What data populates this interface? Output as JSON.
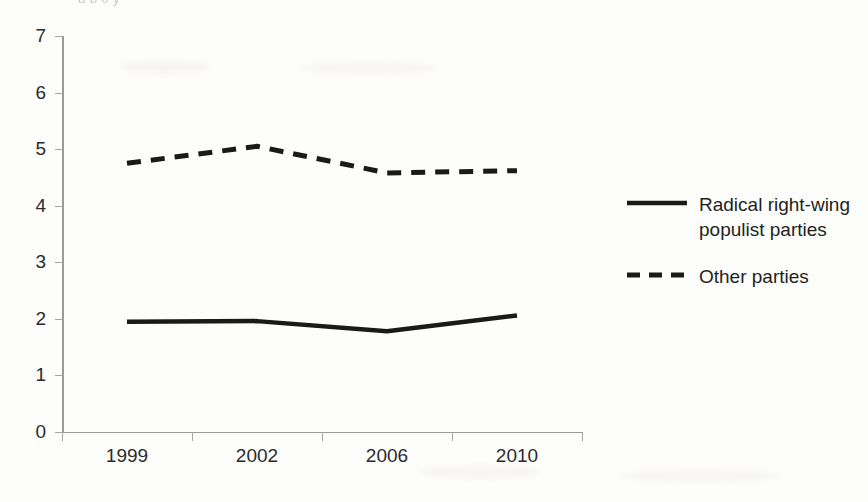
{
  "page": {
    "clipped_caption": "a   b                                                         0                              y"
  },
  "chart_data": {
    "type": "line",
    "title": "",
    "xlabel": "",
    "ylabel": "",
    "categories": [
      "1999",
      "2002",
      "2006",
      "2010"
    ],
    "ylim": [
      0,
      7
    ],
    "y_ticks": [
      "7",
      "6",
      "5",
      "4",
      "3",
      "2",
      "1",
      "0"
    ],
    "grid": false,
    "legend_position": "right",
    "series": [
      {
        "name": "Radical right-wing populist parties",
        "style": "solid",
        "color": "#1a1a1a",
        "values": [
          1.95,
          1.96,
          1.78,
          2.06
        ]
      },
      {
        "name": "Other parties",
        "style": "dashed",
        "color": "#1a1a1a",
        "values": [
          4.75,
          5.05,
          4.58,
          4.62
        ]
      }
    ]
  },
  "legend": {
    "items": [
      {
        "label_line1": "Radical right-wing",
        "label_line2": "populist parties",
        "style": "solid"
      },
      {
        "label_line1": "Other parties",
        "label_line2": "",
        "style": "dashed"
      }
    ]
  }
}
